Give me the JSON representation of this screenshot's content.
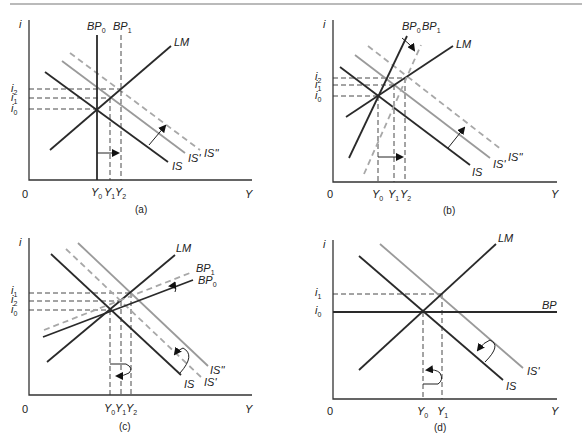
{
  "figure": {
    "panels": [
      {
        "id": "a",
        "caption": "(a)",
        "axes": {
          "y": "i",
          "x": "Y",
          "origin": "0"
        },
        "y_ticks": [
          "i2",
          "i1",
          "i0"
        ],
        "x_ticks": [
          "Y0",
          "Y1",
          "Y2"
        ],
        "curves": [
          {
            "name": "BP0",
            "style": "solid-dark",
            "shape": "vertical"
          },
          {
            "name": "BP1",
            "style": "dashed-dark",
            "shape": "vertical"
          },
          {
            "name": "LM",
            "style": "solid-dark",
            "shape": "upward"
          },
          {
            "name": "IS",
            "style": "solid-dark",
            "shape": "downward"
          },
          {
            "name": "IS'",
            "style": "solid-grey",
            "shape": "downward"
          },
          {
            "name": "IS''",
            "style": "dashed-grey",
            "shape": "downward"
          }
        ],
        "arrows": [
          "IS shifts right to IS''",
          "BP0 shifts right to BP1"
        ]
      },
      {
        "id": "b",
        "caption": "(b)",
        "axes": {
          "y": "i",
          "x": "Y",
          "origin": "0"
        },
        "y_ticks": [
          "i2",
          "i1",
          "i0"
        ],
        "x_ticks": [
          "Y0",
          "Y1",
          "Y2"
        ],
        "curves": [
          {
            "name": "BP0",
            "style": "solid-dark",
            "shape": "steep-upward"
          },
          {
            "name": "BP1",
            "style": "dashed-grey",
            "shape": "steep-upward"
          },
          {
            "name": "LM",
            "style": "solid-dark",
            "shape": "upward"
          },
          {
            "name": "IS",
            "style": "solid-dark",
            "shape": "downward"
          },
          {
            "name": "IS'",
            "style": "solid-grey",
            "shape": "downward"
          },
          {
            "name": "IS''",
            "style": "dashed-grey",
            "shape": "downward"
          }
        ],
        "arrows": [
          "IS shifts right to IS''",
          "BP0 shifts right to BP1"
        ]
      },
      {
        "id": "c",
        "caption": "(c)",
        "axes": {
          "y": "i",
          "x": "Y",
          "origin": "0"
        },
        "y_ticks": [
          "i1",
          "i2",
          "i0"
        ],
        "x_ticks": [
          "Y0",
          "Y1",
          "Y2"
        ],
        "curves": [
          {
            "name": "LM",
            "style": "solid-dark",
            "shape": "upward"
          },
          {
            "name": "BP1",
            "style": "dashed-grey",
            "shape": "flat-upward"
          },
          {
            "name": "BP0",
            "style": "solid-dark",
            "shape": "flat-upward"
          },
          {
            "name": "IS''",
            "style": "solid-grey",
            "shape": "downward"
          },
          {
            "name": "IS'",
            "style": "dashed-grey",
            "shape": "downward"
          },
          {
            "name": "IS",
            "style": "solid-dark",
            "shape": "downward"
          }
        ],
        "arrows": [
          "IS'' shifts back left to IS'",
          "BP0 shifts up to BP1",
          "Y curls back from Y2 to Y1"
        ]
      },
      {
        "id": "d",
        "caption": "(d)",
        "axes": {
          "y": "i",
          "x": "Y",
          "origin": "0"
        },
        "y_ticks": [
          "i1",
          "i0"
        ],
        "x_ticks": [
          "Y0",
          "Y1"
        ],
        "curves": [
          {
            "name": "LM",
            "style": "solid-dark",
            "shape": "upward"
          },
          {
            "name": "BP",
            "style": "solid-dark",
            "shape": "horizontal"
          },
          {
            "name": "IS'",
            "style": "solid-grey",
            "shape": "downward"
          },
          {
            "name": "IS",
            "style": "solid-dark",
            "shape": "downward"
          }
        ],
        "arrows": [
          "IS' shifts back left to IS",
          "Y returns from Y1 to Y0"
        ]
      }
    ]
  },
  "labels": {
    "i": "i",
    "Y": "Y",
    "O": "0",
    "a": {
      "cap": "(a)",
      "BP0": "BP",
      "BP0s": "0",
      "BP1": "BP",
      "BP1s": "1",
      "LM": "LM",
      "IS": "IS",
      "ISp": "IS'",
      "ISpp": "IS''",
      "i2": "i",
      "i2s": "2",
      "i1": "i",
      "i1s": "1",
      "i0": "i",
      "i0s": "0",
      "Y0": "Y",
      "Y0s": "0",
      "Y1": "Y",
      "Y1s": "1",
      "Y2": "Y",
      "Y2s": "2"
    },
    "b": {
      "cap": "(b)",
      "BP0": "BP",
      "BP0s": "0",
      "BP1": "BP",
      "BP1s": "1",
      "LM": "LM",
      "IS": "IS",
      "ISp": "IS'",
      "ISpp": "IS''",
      "i2": "i",
      "i2s": "2",
      "i1": "i",
      "i1s": "1",
      "i0": "i",
      "i0s": "0",
      "Y0": "Y",
      "Y0s": "0",
      "Y1": "Y",
      "Y1s": "1",
      "Y2": "Y",
      "Y2s": "2"
    },
    "c": {
      "cap": "(c)",
      "BP0": "BP",
      "BP0s": "0",
      "BP1": "BP",
      "BP1s": "1",
      "LM": "LM",
      "IS": "IS",
      "ISp": "IS'",
      "ISpp": "IS''",
      "i1": "i",
      "i1s": "1",
      "i2": "i",
      "i2s": "2",
      "i0": "i",
      "i0s": "0",
      "Y0": "Y",
      "Y0s": "0",
      "Y1": "Y",
      "Y1s": "1",
      "Y2": "Y",
      "Y2s": "2"
    },
    "d": {
      "cap": "(d)",
      "BP": "BP",
      "LM": "LM",
      "IS": "IS",
      "ISp": "IS'",
      "i1": "i",
      "i1s": "1",
      "i0": "i",
      "i0s": "0",
      "Y0": "Y",
      "Y0s": "0",
      "Y1": "Y",
      "Y1s": "1"
    }
  }
}
